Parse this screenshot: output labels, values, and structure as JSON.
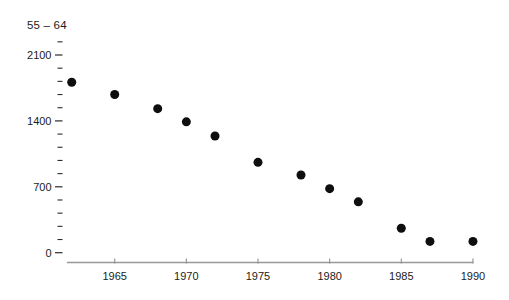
{
  "colors": {
    "background": "#ffffff",
    "point": "#0e0e0e",
    "x_axis_line": "#999999",
    "x_tick": "#8f8f8f",
    "y_tick": "#2b2b2b",
    "text": "#1b1b1b"
  },
  "chart_data": {
    "type": "scatter",
    "title": "55 – 64",
    "xlabel": "",
    "ylabel": "",
    "grid": false,
    "legend": null,
    "x_axis": {
      "ticks": [
        1965,
        1970,
        1975,
        1980,
        1985,
        1990
      ],
      "min": 1962,
      "max": 1990
    },
    "y_axis": {
      "major_ticks": [
        0,
        700,
        1400,
        2100
      ],
      "minor_step": 140,
      "top_tick": 2240,
      "ylim": [
        0,
        2240
      ]
    },
    "points": [
      {
        "x": 1962,
        "y": 1810
      },
      {
        "x": 1965,
        "y": 1680
      },
      {
        "x": 1968,
        "y": 1530
      },
      {
        "x": 1970,
        "y": 1390
      },
      {
        "x": 1972,
        "y": 1240
      },
      {
        "x": 1975,
        "y": 960
      },
      {
        "x": 1978,
        "y": 825
      },
      {
        "x": 1980,
        "y": 680
      },
      {
        "x": 1982,
        "y": 540
      },
      {
        "x": 1985,
        "y": 260
      },
      {
        "x": 1987,
        "y": 120
      },
      {
        "x": 1990,
        "y": 120
      }
    ]
  }
}
